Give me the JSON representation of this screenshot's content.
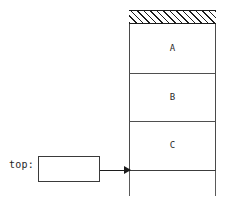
{
  "diagram": {
    "stack": {
      "hatched_band": {
        "name": "hatched-region",
        "fill": "diagonal-hatch",
        "color": "#1c1c1c"
      },
      "cells": [
        {
          "label": "A"
        },
        {
          "label": "B"
        },
        {
          "label": "C"
        }
      ]
    },
    "pointer": {
      "label": "top:",
      "value": "",
      "arrow": "arrow-right"
    },
    "colors": {
      "line": "#4a4a4a",
      "hatch": "#1c1c1c",
      "text": "#1f1f1f",
      "background": "#ffffff"
    }
  }
}
